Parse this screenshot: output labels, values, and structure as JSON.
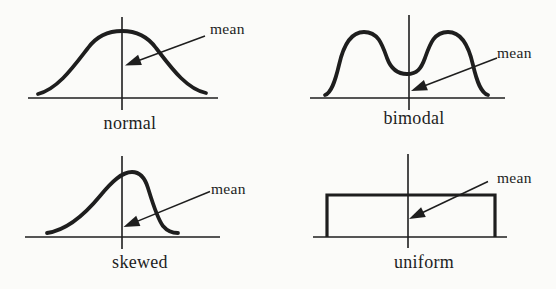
{
  "colors": {
    "ink": "#1e1e1e",
    "paper": "#fbfbf9"
  },
  "figure": {
    "panels": [
      {
        "name": "normal",
        "label": "normal",
        "annotation": "mean",
        "shape": "symmetric bell curve; mean arrow points to the central vertical axis under the peak"
      },
      {
        "name": "bimodal",
        "label": "bimodal",
        "annotation": "mean",
        "shape": "two equal humps with a central dip; mean arrow points to the base of the central vertical axis"
      },
      {
        "name": "skewed",
        "label": "skewed",
        "annotation": "mean",
        "shape": "long left tail with peak just right of the vertical axis; mean arrow points to the axis below the peak"
      },
      {
        "name": "uniform",
        "label": "uniform",
        "annotation": "mean",
        "shape": "flat rectangular distribution; mean arrow points to the central vertical axis inside the rectangle"
      }
    ]
  }
}
